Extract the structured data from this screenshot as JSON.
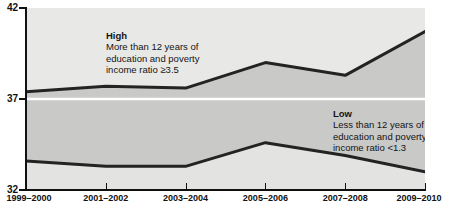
{
  "chart_data": {
    "type": "line",
    "title": "",
    "subtitle": "",
    "xlabel": "",
    "ylabel": "",
    "categories": [
      "1999–2000",
      "2001–2002",
      "2003–2004",
      "2005–2006",
      "2007–2008",
      "2009–2010"
    ],
    "x_tick_labels": [
      "1999–2000",
      "2001–2002",
      "2003–2004",
      "2005–2006",
      "2007–2008",
      "2009–2010"
    ],
    "y_tick_labels": [
      "42",
      "37",
      "32"
    ],
    "y_ticks": [
      42,
      37,
      32
    ],
    "ylim": [
      32,
      42
    ],
    "grid": true,
    "gridline_values": [
      37
    ],
    "legend_position": "inline-annotations",
    "series": [
      {
        "name": "High",
        "description": "More than 12 years of education and poverty income ratio ≥3.5",
        "values": [
          37.4,
          37.7,
          37.6,
          39.0,
          38.3,
          40.7
        ]
      },
      {
        "name": "Low",
        "description": "Less than 12 years of education and poverty income ratio <1.3",
        "values": [
          33.6,
          33.3,
          33.3,
          34.6,
          33.9,
          33.0
        ]
      }
    ],
    "annotations": [
      {
        "id": "high",
        "title": "High",
        "lines": [
          "More than 12 years of",
          "education and poverty",
          "income ratio ≥3.5"
        ]
      },
      {
        "id": "low",
        "title": "Low",
        "lines": [
          "Less than 12 years of",
          "education and poverty",
          "income ratio <1.3"
        ]
      }
    ],
    "colors": {
      "band_above_high": "#e8e8e6",
      "band_between": "#c9c9c7",
      "band_below_low": "#e3e3e1",
      "line": "#232323",
      "gridline": "#ffffff",
      "axis": "#111111",
      "text": "#141414",
      "background": "#ffffff"
    }
  },
  "axis": {
    "y_labels": [
      {
        "text": "42",
        "value": 42
      },
      {
        "text": "37",
        "value": 37
      },
      {
        "text": "32",
        "value": 32
      }
    ],
    "x_labels": [
      {
        "text": "1999–2000"
      },
      {
        "text": "2001–2002"
      },
      {
        "text": "2003–2004"
      },
      {
        "text": "2005–2006"
      },
      {
        "text": "2007–2008"
      },
      {
        "text": "2009–2010"
      }
    ]
  },
  "annotation_high": {
    "title": "High",
    "line1": "More than 12 years of",
    "line2": "education and poverty",
    "line3": "income ratio ≥3.5"
  },
  "annotation_low": {
    "title": "Low",
    "line1": "Less than 12 years of",
    "line2": "education and poverty",
    "line3": "income ratio <1.3"
  }
}
